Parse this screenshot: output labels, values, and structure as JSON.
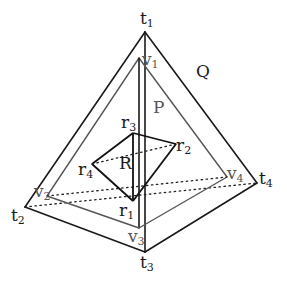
{
  "diagram": {
    "bodies": [
      {
        "name": "Q",
        "label": "Q",
        "vertices": [
          "t1",
          "t2",
          "t3",
          "t4"
        ]
      },
      {
        "name": "P",
        "label": "P",
        "vertices": [
          "v1",
          "v2",
          "v3",
          "v4"
        ]
      },
      {
        "name": "R",
        "label": "R",
        "vertices": [
          "r1",
          "r2",
          "r3",
          "r4"
        ]
      }
    ],
    "labels": {
      "t1": {
        "base": "t",
        "sub": "1"
      },
      "t2": {
        "base": "t",
        "sub": "2"
      },
      "t3": {
        "base": "t",
        "sub": "3"
      },
      "t4": {
        "base": "t",
        "sub": "4"
      },
      "v1": {
        "base": "v",
        "sub": "1"
      },
      "v2": {
        "base": "v",
        "sub": "2"
      },
      "v3": {
        "base": "v",
        "sub": "3"
      },
      "v4": {
        "base": "v",
        "sub": "4"
      },
      "r1": {
        "base": "r",
        "sub": "1"
      },
      "r2": {
        "base": "r",
        "sub": "2"
      },
      "r3": {
        "base": "r",
        "sub": "3"
      },
      "r4": {
        "base": "r",
        "sub": "4"
      },
      "Q": "Q",
      "P": "P",
      "R": "R"
    },
    "colors": {
      "outer_edges": "#1a1a1a",
      "inner_edges": "#555555",
      "background": "#ffffff"
    }
  }
}
